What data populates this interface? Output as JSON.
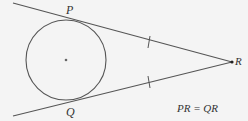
{
  "diagram": {
    "type": "geometry",
    "colors": {
      "background": "#f4f4f4",
      "stroke": "#555555",
      "text": "#333333"
    },
    "circle": {
      "cx": 66,
      "cy": 60,
      "r": 40,
      "center_dot": true
    },
    "points": {
      "P": {
        "label": "P",
        "x": 70,
        "y": 20
      },
      "Q": {
        "label": "Q",
        "x": 70,
        "y": 100
      },
      "R": {
        "label": "R",
        "x": 232,
        "y": 62
      }
    },
    "lines": [
      {
        "name": "tangent-PR",
        "from": [
          13,
          3
        ],
        "to": [
          232,
          62
        ]
      },
      {
        "name": "tangent-QR",
        "from": [
          13,
          116
        ],
        "to": [
          232,
          62
        ]
      }
    ],
    "tick_marks": [
      {
        "on": "PR",
        "x": 148,
        "y": 44
      },
      {
        "on": "QR",
        "x": 148,
        "y": 82
      }
    ],
    "equation": "PR = QR"
  }
}
